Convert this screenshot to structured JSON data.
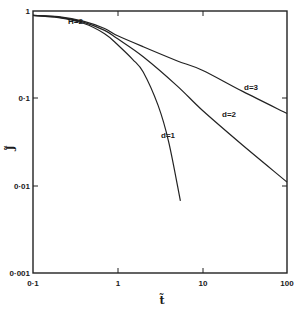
{
  "chart_data": {
    "type": "line",
    "title": "",
    "xlabel": "t̃",
    "ylabel": "J̃",
    "xscale": "log",
    "yscale": "log",
    "xlim": [
      0.1,
      100
    ],
    "ylim": [
      0.001,
      1
    ],
    "grid": false,
    "x_ticks": [
      "0·1",
      "1",
      "10",
      "100"
    ],
    "y_ticks": [
      "1",
      "0·1",
      "0·01",
      "0·001"
    ],
    "annotations": [
      {
        "text": "H=2",
        "x": 0.28,
        "y": 0.88
      }
    ],
    "series": [
      {
        "name": "d=1",
        "x": [
          0.1,
          0.2,
          0.4,
          0.7,
          1.0,
          1.5,
          2.0,
          3.0,
          4.0,
          5.5
        ],
        "y": [
          0.89,
          0.84,
          0.72,
          0.55,
          0.41,
          0.28,
          0.2,
          0.083,
          0.032,
          0.0067
        ]
      },
      {
        "name": "d=2",
        "x": [
          0.1,
          0.2,
          0.4,
          0.7,
          1.0,
          2.0,
          5.0,
          10,
          30,
          100
        ],
        "y": [
          0.89,
          0.85,
          0.74,
          0.6,
          0.48,
          0.3,
          0.14,
          0.073,
          0.029,
          0.011
        ]
      },
      {
        "name": "d=3",
        "x": [
          0.1,
          0.2,
          0.4,
          0.7,
          1.0,
          2.0,
          5.0,
          10,
          30,
          100
        ],
        "y": [
          0.89,
          0.86,
          0.76,
          0.63,
          0.52,
          0.39,
          0.27,
          0.21,
          0.12,
          0.067
        ]
      }
    ]
  },
  "labels": {
    "annotation_H": "H=2",
    "d1": "d=1",
    "d2": "d=2",
    "d3": "d=3",
    "x_axis": "t̃",
    "y_axis": "J̃",
    "x_ticks": [
      "0·1",
      "1",
      "10",
      "100"
    ],
    "y_ticks": [
      "1",
      "0·1",
      "0·01",
      "0·001"
    ]
  }
}
